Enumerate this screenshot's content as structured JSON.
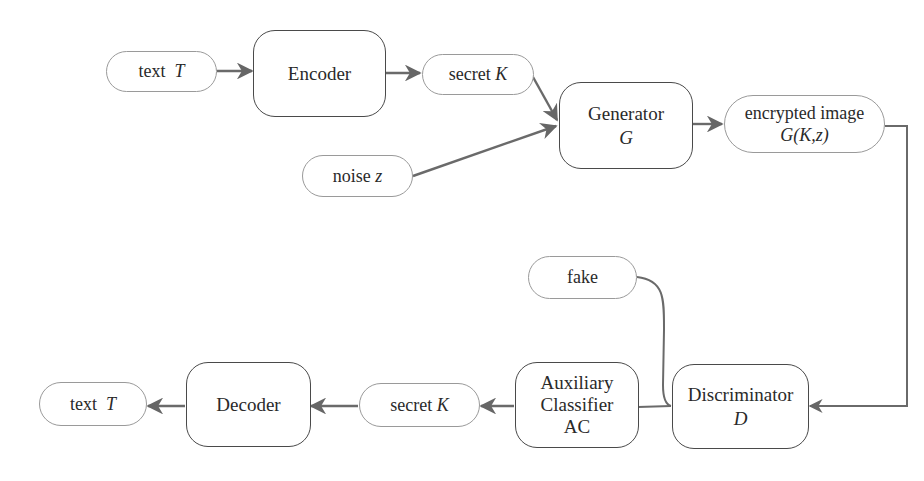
{
  "diagram": {
    "type": "flowchart",
    "nodes": {
      "text_in": {
        "label": "text",
        "var": "T",
        "shape": "pill"
      },
      "encoder": {
        "label": "Encoder",
        "shape": "rounded-box"
      },
      "secret_in": {
        "label": "secret",
        "var": "K",
        "shape": "pill"
      },
      "noise": {
        "label": "noise",
        "var": "z",
        "shape": "pill"
      },
      "generator": {
        "label": "Generator",
        "var": "G",
        "shape": "rounded-box"
      },
      "encrypted": {
        "label": "encrypted image",
        "var": "G(K,z)",
        "shape": "pill"
      },
      "fake": {
        "label": "fake",
        "shape": "pill"
      },
      "discriminator": {
        "label": "Discriminator",
        "var": "D",
        "shape": "rounded-box"
      },
      "aux_classifier": {
        "line1": "Auxiliary",
        "line2": "Classifier",
        "line3": "AC",
        "shape": "rounded-box"
      },
      "secret_out": {
        "label": "secret",
        "var": "K",
        "shape": "pill"
      },
      "decoder": {
        "label": "Decoder",
        "shape": "rounded-box"
      },
      "text_out": {
        "label": "text",
        "var": "T",
        "shape": "pill"
      }
    },
    "edges": [
      {
        "from": "text_in",
        "to": "encoder"
      },
      {
        "from": "encoder",
        "to": "secret_in"
      },
      {
        "from": "secret_in",
        "to": "generator"
      },
      {
        "from": "noise",
        "to": "generator"
      },
      {
        "from": "generator",
        "to": "encrypted"
      },
      {
        "from": "encrypted",
        "to": "discriminator"
      },
      {
        "from": "fake",
        "to": "discriminator",
        "style": "curve"
      },
      {
        "from": "aux_classifier",
        "to": "discriminator",
        "style": "line"
      },
      {
        "from": "aux_classifier",
        "to": "secret_out"
      },
      {
        "from": "secret_out",
        "to": "decoder"
      },
      {
        "from": "decoder",
        "to": "text_out"
      }
    ],
    "colors": {
      "edge": "#666666",
      "node_border": "#4a4a4a",
      "pill_border": "#9a9a9a"
    }
  }
}
